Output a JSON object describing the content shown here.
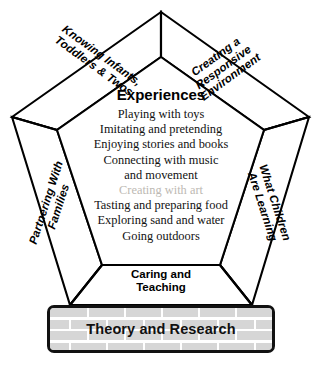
{
  "diagram": {
    "colors": {
      "outline": "#000000",
      "panel_background": "#ffffff",
      "muted_text": "#bdb9b3",
      "brick_fill": "#d6d6d6",
      "mortar": "#ffffff"
    },
    "bands": {
      "top_left": "Knowing Infants,\nToddlers & Twos",
      "top_right": "Creating a Responsive\nEnvironment",
      "left": "Partnering With\nFamilies",
      "right": "What Children\nAre Learning",
      "bottom": "Caring and\nTeaching"
    },
    "center": {
      "title": "Experiences",
      "items": [
        {
          "label": "Playing with toys",
          "muted": false
        },
        {
          "label": "Imitating and pretending",
          "muted": false
        },
        {
          "label": "Enjoying stories and books",
          "muted": false
        },
        {
          "label": "Connecting with music\nand movement",
          "muted": false
        },
        {
          "label": "Creating with art",
          "muted": true
        },
        {
          "label": "Tasting and preparing food",
          "muted": false
        },
        {
          "label": "Exploring sand and water",
          "muted": false
        },
        {
          "label": "Going outdoors",
          "muted": false
        }
      ]
    },
    "foundation": {
      "label": "Theory and Research"
    }
  }
}
